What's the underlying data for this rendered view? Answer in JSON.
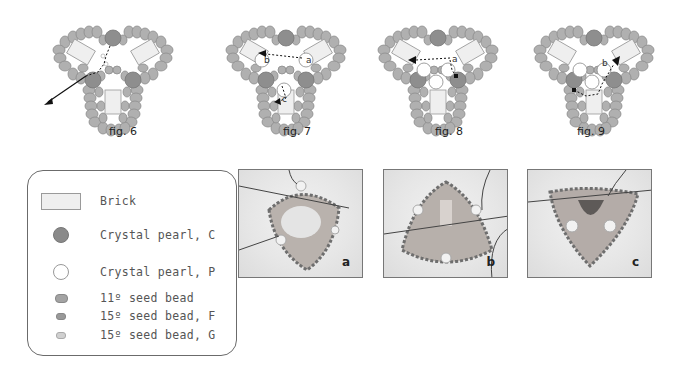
{
  "figures": [
    {
      "id": "fig6",
      "label": "fig. 6"
    },
    {
      "id": "fig7",
      "label": "fig. 7",
      "annotations": [
        "b",
        "a",
        "c"
      ]
    },
    {
      "id": "fig8",
      "label": "fig. 8",
      "annotations": [
        "a"
      ]
    },
    {
      "id": "fig9",
      "label": "fig. 9",
      "annotations": [
        "b"
      ]
    }
  ],
  "legend": {
    "items": [
      {
        "symbol": "brick-swatch",
        "label": "Brick"
      },
      {
        "symbol": "crystal-pearl-c-swatch",
        "label": "Crystal pearl, C"
      },
      {
        "symbol": "crystal-pearl-p-swatch",
        "label": "Crystal pearl, P"
      },
      {
        "symbol": "seed-bead-11-swatch",
        "label": "11º seed bead"
      },
      {
        "symbol": "seed-bead-15f-swatch",
        "label": "15º seed bead, F"
      },
      {
        "symbol": "seed-bead-15g-swatch",
        "label": "15º seed bead, G"
      }
    ]
  },
  "photos": [
    {
      "id": "photo-a",
      "label": "a"
    },
    {
      "id": "photo-b",
      "label": "b"
    },
    {
      "id": "photo-c",
      "label": "c"
    }
  ],
  "colors": {
    "bead_gray": "#a8a8a8",
    "pearl_c": "#8a8a8a",
    "brick": "#efefef",
    "border": "#6b6b6b"
  }
}
